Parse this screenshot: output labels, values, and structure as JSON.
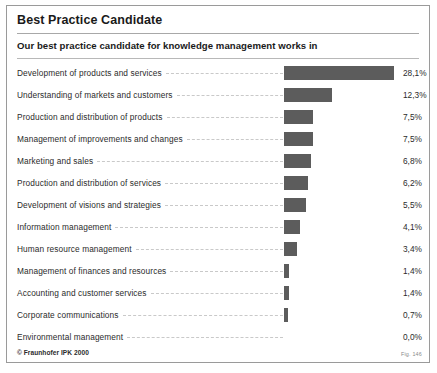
{
  "figure": {
    "title": "Best Practice Candidate",
    "subtitle": "Our best practice candidate for knowledge management works in",
    "credit": "© Fraunhofer IPK 2000",
    "figure_number": "Fig. 146",
    "bar_color": "#5c5c5c",
    "border_color": "#9a9a9a",
    "leader_color": "#c9c9c9"
  },
  "chart_data": {
    "type": "bar",
    "orientation": "horizontal",
    "title": "Best Practice Candidate",
    "subtitle": "Our best practice candidate for knowledge management works in",
    "xlabel": "",
    "ylabel": "",
    "xlim": [
      0,
      28.1
    ],
    "grid": false,
    "legend": null,
    "value_suffix": "%",
    "decimal_separator": ",",
    "categories": [
      "Development of products and services",
      "Understanding of markets and customers",
      "Production and distribution of products",
      "Management of improvements and changes",
      "Marketing and sales",
      "Production and distribution of services",
      "Development of visions and strategies",
      "Information management",
      "Human resource management",
      "Management of finances and resources",
      "Accounting and customer services",
      "Corporate communications",
      "Environmental management"
    ],
    "values": [
      28.1,
      12.3,
      7.5,
      7.5,
      6.8,
      6.2,
      5.5,
      4.1,
      3.4,
      1.4,
      1.4,
      0.7,
      0.0
    ],
    "value_labels": [
      "28,1%",
      "12,3%",
      "7,5%",
      "7,5%",
      "6,8%",
      "6,2%",
      "5,5%",
      "4,1%",
      "3,4%",
      "1,4%",
      "1,4%",
      "0,7%",
      "0,0%"
    ]
  }
}
